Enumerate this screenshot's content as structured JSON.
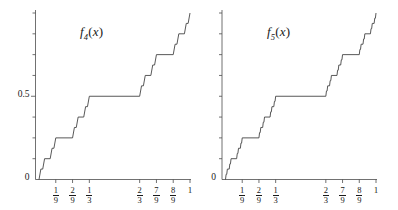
{
  "figure": {
    "background": "#ffffff",
    "line_color": "#3a3a3a",
    "axis_color": "#4d4d4d",
    "width": 398,
    "height": 210
  },
  "chart_data": {
    "type": "line",
    "title": "",
    "panels": [
      {
        "id": "f4",
        "title_base": "f",
        "title_sub": "4",
        "title_arg": "(x)",
        "iteration": 4,
        "xlabel": "",
        "ylabel": "",
        "xlim": [
          0,
          1
        ],
        "ylim": [
          0,
          1
        ],
        "grid": false,
        "legend": null,
        "y_ticks": [
          {
            "value": 0,
            "label": "0"
          },
          {
            "value": 0.125,
            "label": ""
          },
          {
            "value": 0.25,
            "label": ""
          },
          {
            "value": 0.375,
            "label": ""
          },
          {
            "value": 0.5,
            "label": "0.5"
          },
          {
            "value": 0.625,
            "label": ""
          },
          {
            "value": 0.75,
            "label": ""
          },
          {
            "value": 0.875,
            "label": ""
          },
          {
            "value": 1.0,
            "label": ""
          }
        ],
        "x_ticks": [
          {
            "value": 0.1111111,
            "num": "1",
            "den": "9"
          },
          {
            "value": 0.2222222,
            "num": "2",
            "den": "9"
          },
          {
            "value": 0.3333333,
            "num": "1",
            "den": "3"
          },
          {
            "value": 0.6666667,
            "num": "2",
            "den": "3"
          },
          {
            "value": 0.7777778,
            "num": "7",
            "den": "9"
          },
          {
            "value": 0.8888889,
            "num": "8",
            "den": "9"
          },
          {
            "value": 1.0,
            "num": "1",
            "den": ""
          }
        ]
      },
      {
        "id": "f5",
        "title_base": "f",
        "title_sub": "5",
        "title_arg": "(x)",
        "iteration": 5,
        "xlabel": "",
        "ylabel": "",
        "xlim": [
          0,
          1
        ],
        "ylim": [
          0,
          1
        ],
        "grid": false,
        "legend": null,
        "y_ticks": [
          {
            "value": 0,
            "label": "0"
          },
          {
            "value": 0.125,
            "label": ""
          },
          {
            "value": 0.25,
            "label": ""
          },
          {
            "value": 0.375,
            "label": ""
          },
          {
            "value": 0.5,
            "label": ""
          },
          {
            "value": 0.625,
            "label": ""
          },
          {
            "value": 0.75,
            "label": ""
          },
          {
            "value": 0.875,
            "label": ""
          },
          {
            "value": 1.0,
            "label": ""
          }
        ],
        "x_ticks": [
          {
            "value": 0.1111111,
            "num": "1",
            "den": "9"
          },
          {
            "value": 0.2222222,
            "num": "2",
            "den": "9"
          },
          {
            "value": 0.3333333,
            "num": "1",
            "den": "3"
          },
          {
            "value": 0.6666667,
            "num": "2",
            "den": "3"
          },
          {
            "value": 0.7777778,
            "num": "7",
            "den": "9"
          },
          {
            "value": 0.8888889,
            "num": "8",
            "den": "9"
          },
          {
            "value": 1.0,
            "num": "1",
            "den": ""
          }
        ]
      }
    ],
    "construction": {
      "rule": "f_n(x) = 0.5*f_{n-1}(3x) on [0,1/3]; 0.5 on [1/3,2/3]; 0.5+0.5*f_{n-1}(3x-2) on [2/3,1]",
      "base_case": "f_0(x) = x",
      "key_plateaus": [
        {
          "interval": [
            0.3333333,
            0.6666667
          ],
          "value": 0.5
        },
        {
          "interval": [
            0.1111111,
            0.2222222
          ],
          "value": 0.25
        },
        {
          "interval": [
            0.7777778,
            0.8888889
          ],
          "value": 0.75
        }
      ]
    }
  }
}
